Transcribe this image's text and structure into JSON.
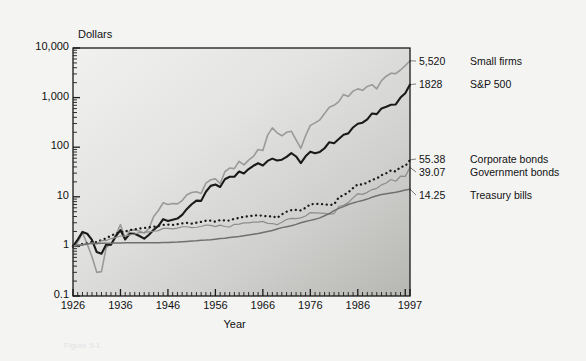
{
  "figure": {
    "background_color": "#f4f4f3",
    "plot_fill_light": "#efefee",
    "plot_fill_dark": "#b9b9b7",
    "caption": "Figure 5-1"
  },
  "chart_data": {
    "type": "line",
    "title": "",
    "xlabel": "Year",
    "ylabel": "Dollars",
    "ylabel_position": "above-axis",
    "yscale": "log",
    "ylim": [
      0.1,
      10000
    ],
    "xlim": [
      1926,
      1997
    ],
    "grid": false,
    "legend_position": "right-of-axes",
    "ytick_labels": [
      "10,000",
      "1,000",
      "100",
      "10",
      "1",
      "0.1"
    ],
    "ytick_values": [
      10000,
      1000,
      100,
      10,
      1,
      0.1
    ],
    "xtick_labels": [
      "1926",
      "1936",
      "1946",
      "1956",
      "1966",
      "1976",
      "1986",
      "1997"
    ],
    "xtick_values": [
      1926,
      1936,
      1946,
      1956,
      1966,
      1976,
      1986,
      1997
    ],
    "x": [
      1926,
      1927,
      1928,
      1929,
      1930,
      1931,
      1932,
      1933,
      1934,
      1935,
      1936,
      1937,
      1938,
      1939,
      1940,
      1941,
      1942,
      1943,
      1944,
      1945,
      1946,
      1947,
      1948,
      1949,
      1950,
      1951,
      1952,
      1953,
      1954,
      1955,
      1956,
      1957,
      1958,
      1959,
      1960,
      1961,
      1962,
      1963,
      1964,
      1965,
      1966,
      1967,
      1968,
      1969,
      1970,
      1971,
      1972,
      1973,
      1974,
      1975,
      1976,
      1977,
      1978,
      1979,
      1980,
      1981,
      1982,
      1983,
      1984,
      1985,
      1986,
      1987,
      1988,
      1989,
      1990,
      1991,
      1992,
      1993,
      1994,
      1995,
      1996,
      1997
    ],
    "series": [
      {
        "name": "Small firms",
        "end_value_label": "5,520",
        "end_value": 5520,
        "color": "#9a9a98",
        "style": "solid",
        "width": 1.6,
        "values": [
          1.0,
          1.22,
          1.87,
          1.11,
          0.62,
          0.3,
          0.31,
          0.95,
          1.12,
          1.68,
          2.74,
          1.46,
          2.12,
          2.15,
          2.05,
          1.85,
          2.3,
          4.0,
          5.3,
          7.6,
          7.0,
          7.3,
          7.2,
          8.4,
          11.0,
          12.2,
          12.6,
          11.7,
          18.8,
          22.0,
          23.0,
          18.5,
          32.0,
          38.0,
          37.0,
          52.0,
          44.0,
          55.0,
          65.0,
          90.0,
          86.0,
          175.0,
          245.0,
          195.0,
          170.0,
          200.0,
          210.0,
          140.0,
          95.0,
          170.0,
          275.0,
          310.0,
          355.0,
          480.0,
          640.0,
          700.0,
          830.0,
          1160.0,
          1050.0,
          1350.0,
          1500.0,
          1400.0,
          1680.0,
          1820.0,
          1500.0,
          2200.0,
          2700.0,
          3100.0,
          3050.0,
          3600.0,
          4400.0,
          5520.0
        ]
      },
      {
        "name": "S&P 500",
        "end_value_label": "1828",
        "end_value": 1828,
        "color": "#1a1a1a",
        "style": "solid",
        "width": 2.1,
        "values": [
          1.0,
          1.37,
          1.96,
          1.8,
          1.35,
          0.77,
          0.71,
          1.09,
          1.08,
          1.59,
          2.13,
          1.38,
          1.81,
          1.8,
          1.62,
          1.43,
          1.72,
          2.17,
          2.6,
          3.55,
          3.26,
          3.45,
          3.64,
          4.33,
          5.7,
          7.07,
          8.37,
          8.28,
          12.63,
          16.6,
          17.7,
          15.8,
          22.6,
          25.3,
          25.4,
          32.3,
          29.5,
          36.2,
          42.2,
          47.5,
          42.7,
          53.0,
          58.8,
          53.8,
          56.0,
          64.0,
          76.2,
          65.0,
          47.8,
          65.6,
          81.3,
          75.5,
          80.4,
          95.3,
          126.2,
          120.0,
          145.8,
          178.7,
          190.0,
          250.0,
          297.0,
          312.0,
          364.0,
          479.0,
          464.0,
          606.0,
          652.0,
          717.0,
          727.0,
          1000.0,
          1229.0,
          1828.0
        ]
      },
      {
        "name": "Corporate bonds",
        "end_value_label": "55.38",
        "end_value": 55.38,
        "color": "#1a1a1a",
        "style": "dotted",
        "width": 2.3,
        "values": [
          1.0,
          1.07,
          1.11,
          1.15,
          1.24,
          1.22,
          1.35,
          1.45,
          1.65,
          1.8,
          1.93,
          2.0,
          2.13,
          2.21,
          2.29,
          2.36,
          2.42,
          2.49,
          2.6,
          2.7,
          2.75,
          2.71,
          2.8,
          2.91,
          2.97,
          2.89,
          3.0,
          3.12,
          3.3,
          3.31,
          3.15,
          3.4,
          3.33,
          3.32,
          3.63,
          3.73,
          3.99,
          4.02,
          4.22,
          4.19,
          4.18,
          4.0,
          4.08,
          3.76,
          4.43,
          5.0,
          5.38,
          5.45,
          5.31,
          5.99,
          7.09,
          7.2,
          7.15,
          7.02,
          6.82,
          7.02,
          9.75,
          10.8,
          12.3,
          15.0,
          17.9,
          17.6,
          19.4,
          21.8,
          23.4,
          27.3,
          29.9,
          34.1,
          32.4,
          40.0,
          41.6,
          55.38
        ]
      },
      {
        "name": "Government bonds",
        "end_value_label": "39.07",
        "end_value": 39.07,
        "color": "#8d8d8b",
        "style": "solid",
        "width": 1.2,
        "values": [
          1.0,
          1.09,
          1.09,
          1.13,
          1.18,
          1.12,
          1.31,
          1.31,
          1.44,
          1.51,
          1.62,
          1.62,
          1.71,
          1.78,
          1.89,
          1.91,
          1.97,
          2.02,
          2.08,
          2.31,
          2.31,
          2.25,
          2.33,
          2.49,
          2.49,
          2.4,
          2.43,
          2.52,
          2.7,
          2.66,
          2.51,
          2.69,
          2.52,
          2.46,
          2.79,
          2.81,
          2.99,
          2.99,
          3.09,
          3.08,
          3.2,
          2.91,
          2.89,
          2.74,
          3.07,
          3.48,
          3.68,
          3.62,
          3.76,
          4.1,
          4.8,
          4.76,
          4.7,
          4.65,
          4.48,
          4.57,
          6.37,
          6.73,
          7.63,
          9.5,
          11.5,
          11.2,
          12.3,
          14.0,
          14.8,
          17.4,
          19.0,
          22.3,
          20.6,
          26.0,
          25.8,
          39.07
        ]
      },
      {
        "name": "Treasury bills",
        "end_value_label": "14.25",
        "end_value": 14.25,
        "color": "#70706e",
        "style": "solid",
        "width": 1.5,
        "values": [
          1.0,
          1.03,
          1.07,
          1.12,
          1.14,
          1.15,
          1.16,
          1.16,
          1.16,
          1.17,
          1.17,
          1.18,
          1.18,
          1.18,
          1.18,
          1.18,
          1.18,
          1.19,
          1.19,
          1.2,
          1.2,
          1.21,
          1.22,
          1.24,
          1.26,
          1.28,
          1.3,
          1.33,
          1.34,
          1.36,
          1.4,
          1.44,
          1.46,
          1.51,
          1.55,
          1.59,
          1.64,
          1.69,
          1.75,
          1.82,
          1.91,
          2.0,
          2.1,
          2.24,
          2.39,
          2.5,
          2.6,
          2.78,
          3.0,
          3.19,
          3.35,
          3.51,
          3.76,
          4.15,
          4.6,
          5.28,
          5.84,
          6.35,
          6.99,
          7.53,
          7.99,
          8.43,
          8.99,
          9.76,
          10.52,
          11.1,
          11.5,
          11.87,
          12.3,
          12.99,
          13.65,
          14.25
        ]
      }
    ]
  }
}
